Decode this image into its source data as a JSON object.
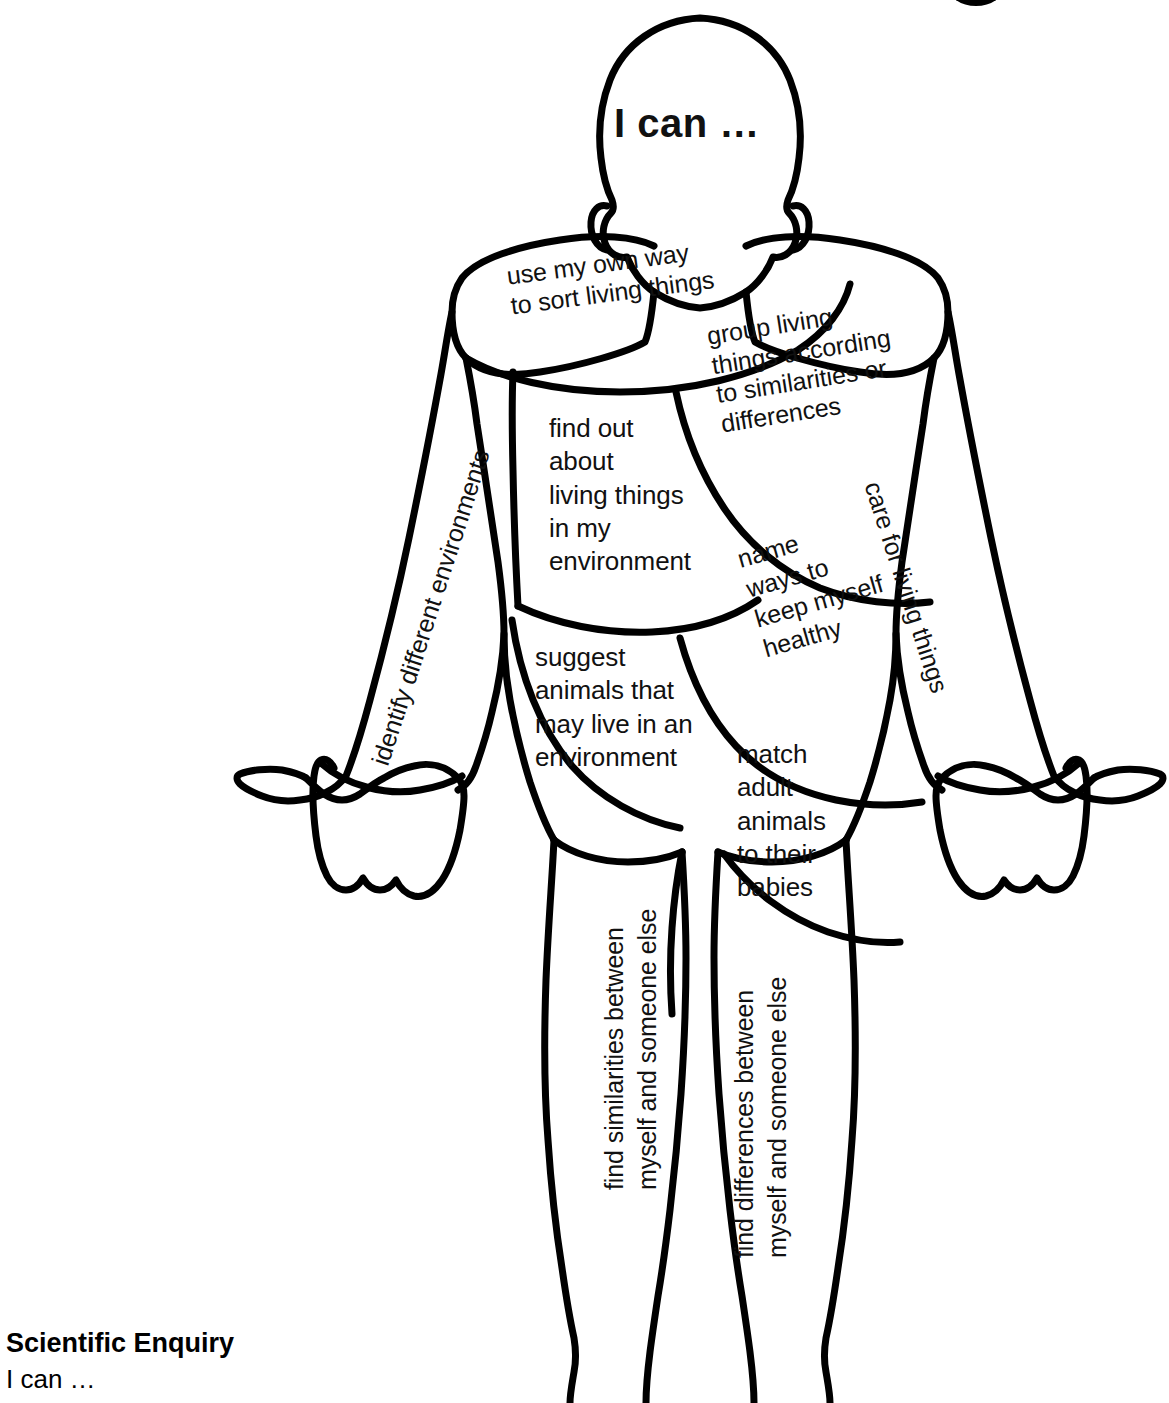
{
  "page": {
    "title_visible_fragment": "",
    "background_color": "#ffffff",
    "ink_color": "#000000"
  },
  "figure": {
    "type": "human-body-outline-diagram",
    "head_label": "I can …"
  },
  "labels": {
    "chest_upper": "use my own way\nto sort living things",
    "chest_right": "group living\nthings according\nto similarities or\ndifferences",
    "torso_left": "find out\nabout\nliving things\nin my\nenvironment",
    "torso_mid": "name\nways to\nkeep myself\nhealthy",
    "abdomen_left": "suggest\nanimals that\nmay live in an\nenvironment",
    "abdomen_right": "match\nadult\nanimals\nto their\nbabies",
    "arm_left": "identify different environments",
    "arm_right": "care for living things",
    "leg_left": "find similarities between\nmyself and someone else",
    "leg_right": "find differences between\nmyself and someone else"
  },
  "footer": {
    "title": "Scientific Enquiry",
    "subtitle": "I can …"
  }
}
